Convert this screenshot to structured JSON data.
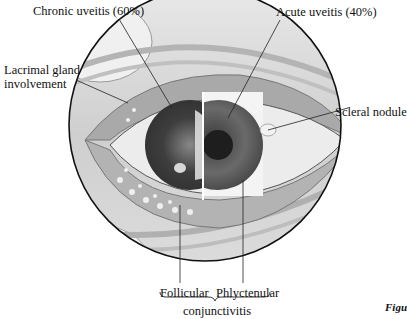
{
  "figure": {
    "caption_fragment": "Figu",
    "labels": {
      "chronic_uveitis": "Chronic uveitis (60%)",
      "acute_uveitis": "Acute uveitis (40%)",
      "lacrimal_line1": "Lacrimal gland",
      "lacrimal_line2": "involvement",
      "scleral_nodule": "Scleral nodule",
      "follicular": "Follicular",
      "phlyctenular": "Phlyctenular",
      "conjunctivitis": "conjunctivitis"
    },
    "colors": {
      "outline": "#111111",
      "sclera": "#e8e8e8",
      "iris_left": "#4a4a4a",
      "iris_right": "#5a5a5a",
      "pupil": "#1e1e1e",
      "skin": "#cfcfcf"
    }
  }
}
